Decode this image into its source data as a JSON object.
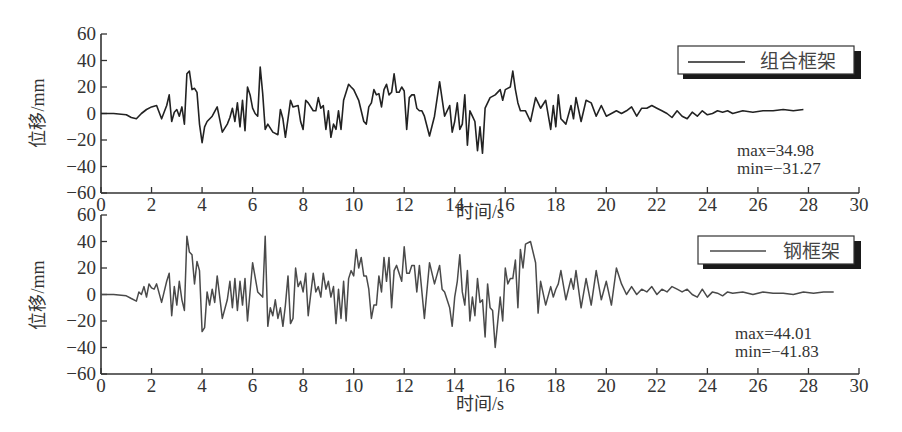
{
  "chart_data": [
    {
      "type": "line",
      "title": "",
      "xlabel": "时间/s",
      "ylabel": "位移/mm",
      "xlim": [
        0,
        30
      ],
      "ylim": [
        -60,
        60
      ],
      "xticks": [
        0,
        2,
        4,
        6,
        8,
        10,
        12,
        14,
        16,
        18,
        20,
        22,
        24,
        26,
        28,
        30
      ],
      "yticks": [
        60,
        40,
        20,
        0,
        -20,
        -40,
        -60
      ],
      "grid": false,
      "legend": {
        "position": "upper right",
        "entries": [
          "组合框架"
        ]
      },
      "annotations": [
        "max=34.98",
        "min=−31.27"
      ],
      "series": [
        {
          "name": "组合框架",
          "color": "#222222",
          "t": [
            0,
            0.5,
            1,
            1.2,
            1.4,
            1.6,
            1.8,
            2,
            2.2,
            2.4,
            2.6,
            2.7,
            2.8,
            2.9,
            3.0,
            3.1,
            3.2,
            3.3,
            3.4,
            3.5,
            3.6,
            3.7,
            3.8,
            3.9,
            4.0,
            4.1,
            4.2,
            4.4,
            4.6,
            4.8,
            5.0,
            5.1,
            5.2,
            5.3,
            5.4,
            5.5,
            5.6,
            5.7,
            5.8,
            5.9,
            6.0,
            6.1,
            6.2,
            6.3,
            6.4,
            6.5,
            6.6,
            6.8,
            7.0,
            7.1,
            7.2,
            7.3,
            7.4,
            7.5,
            7.6,
            7.8,
            7.9,
            8.0,
            8.1,
            8.2,
            8.4,
            8.5,
            8.6,
            8.7,
            8.8,
            8.9,
            9.0,
            9.1,
            9.2,
            9.3,
            9.4,
            9.5,
            9.6,
            9.8,
            9.9,
            10.0,
            10.2,
            10.4,
            10.5,
            10.6,
            10.7,
            10.8,
            10.9,
            11.0,
            11.1,
            11.2,
            11.3,
            11.4,
            11.5,
            11.6,
            11.7,
            11.8,
            11.9,
            12.0,
            12.1,
            12.2,
            12.3,
            12.4,
            12.5,
            12.6,
            12.7,
            12.8,
            13.0,
            13.2,
            13.4,
            13.6,
            13.8,
            13.9,
            14.0,
            14.1,
            14.2,
            14.3,
            14.4,
            14.5,
            14.6,
            14.7,
            14.8,
            14.9,
            15.0,
            15.1,
            15.2,
            15.3,
            15.4,
            15.6,
            15.8,
            15.9,
            16.0,
            16.2,
            16.3,
            16.4,
            16.5,
            16.6,
            16.8,
            17.0,
            17.2,
            17.3,
            17.4,
            17.6,
            17.8,
            17.9,
            18.0,
            18.1,
            18.2,
            18.4,
            18.6,
            18.7,
            18.8,
            19.0,
            19.2,
            19.4,
            19.6,
            19.8,
            20.0,
            20.2,
            20.4,
            20.6,
            20.8,
            21.0,
            21.2,
            21.4,
            21.6,
            21.8,
            22.0,
            22.2,
            22.4,
            22.6,
            22.8,
            23.0,
            23.2,
            23.4,
            23.6,
            23.8,
            24.0,
            24.2,
            24.4,
            24.6,
            24.8,
            25.0,
            25.4,
            25.8,
            26.2,
            26.6,
            27.0,
            27.4,
            27.8,
            28.2,
            28.6,
            29.0,
            29.4,
            29.8,
            30
          ],
          "y": [
            0,
            0,
            -1,
            -3,
            -4,
            0,
            3,
            5,
            6,
            -4,
            6,
            14,
            -6,
            1,
            3,
            -2,
            5,
            -8,
            30,
            32,
            18,
            19,
            16,
            -8,
            -22,
            -10,
            -6,
            -2,
            5,
            -14,
            -8,
            -3,
            4,
            -6,
            8,
            -10,
            10,
            -13,
            20,
            14,
            4,
            0,
            -2,
            35,
            15,
            -12,
            -8,
            -14,
            -16,
            3,
            -4,
            -18,
            -4,
            10,
            5,
            6,
            -6,
            -12,
            10,
            8,
            2,
            2,
            12,
            4,
            6,
            -12,
            2,
            -18,
            -8,
            -12,
            2,
            -12,
            10,
            22,
            20,
            18,
            10,
            -6,
            -8,
            5,
            8,
            18,
            14,
            15,
            5,
            18,
            22,
            14,
            16,
            30,
            16,
            16,
            20,
            17,
            -12,
            12,
            14,
            14,
            4,
            2,
            2,
            -2,
            -17,
            -2,
            24,
            -2,
            6,
            -14,
            -6,
            8,
            -12,
            -8,
            14,
            -24,
            2,
            -2,
            -6,
            -28,
            -10,
            -30,
            4,
            8,
            12,
            14,
            18,
            10,
            18,
            20,
            32,
            18,
            8,
            2,
            2,
            -6,
            12,
            8,
            4,
            10,
            -12,
            6,
            -10,
            14,
            -4,
            -8,
            6,
            -4,
            12,
            -6,
            10,
            8,
            -2,
            6,
            -2,
            0,
            2,
            0,
            2,
            5,
            -2,
            4,
            4,
            6,
            4,
            2,
            0,
            -3,
            2,
            -2,
            -4,
            1,
            -2,
            2,
            -1,
            0,
            2,
            1,
            2,
            0,
            2,
            1,
            2,
            2,
            3,
            2,
            3
          ]
        }
      ]
    },
    {
      "type": "line",
      "title": "",
      "xlabel": "时间/s",
      "ylabel": "位移/mm",
      "xlim": [
        0,
        30
      ],
      "ylim": [
        -60,
        60
      ],
      "xticks": [
        0,
        2,
        4,
        6,
        8,
        10,
        12,
        14,
        16,
        18,
        20,
        22,
        24,
        26,
        28,
        30
      ],
      "yticks": [
        60,
        40,
        20,
        0,
        -20,
        -40,
        -60
      ],
      "grid": false,
      "legend": {
        "position": "upper right",
        "entries": [
          "钢框架"
        ]
      },
      "annotations": [
        "max=44.01",
        "min=−41.83"
      ],
      "series": [
        {
          "name": "钢框架",
          "color": "#4a4a4a",
          "t": [
            0,
            0.5,
            1,
            1.2,
            1.4,
            1.5,
            1.6,
            1.7,
            1.8,
            1.9,
            2.0,
            2.1,
            2.2,
            2.4,
            2.6,
            2.7,
            2.8,
            2.9,
            3.0,
            3.1,
            3.2,
            3.3,
            3.4,
            3.5,
            3.6,
            3.7,
            3.8,
            3.9,
            4.0,
            4.1,
            4.2,
            4.3,
            4.4,
            4.5,
            4.6,
            4.8,
            5.0,
            5.1,
            5.2,
            5.3,
            5.4,
            5.5,
            5.6,
            5.7,
            5.8,
            6.0,
            6.2,
            6.4,
            6.5,
            6.6,
            6.7,
            6.8,
            6.9,
            7.0,
            7.1,
            7.2,
            7.3,
            7.4,
            7.5,
            7.6,
            7.7,
            7.8,
            7.9,
            8.0,
            8.1,
            8.2,
            8.4,
            8.5,
            8.6,
            8.7,
            8.8,
            8.9,
            9.0,
            9.1,
            9.2,
            9.3,
            9.4,
            9.5,
            9.6,
            9.7,
            9.8,
            9.9,
            10.0,
            10.1,
            10.2,
            10.3,
            10.4,
            10.5,
            10.6,
            10.7,
            10.8,
            10.9,
            11.0,
            11.1,
            11.2,
            11.3,
            11.4,
            11.5,
            11.6,
            11.7,
            11.8,
            11.9,
            12.0,
            12.1,
            12.2,
            12.3,
            12.4,
            12.5,
            12.6,
            12.8,
            13.0,
            13.2,
            13.4,
            13.5,
            13.6,
            13.8,
            13.9,
            14.0,
            14.1,
            14.2,
            14.3,
            14.4,
            14.5,
            14.6,
            14.7,
            14.8,
            14.9,
            15.0,
            15.1,
            15.2,
            15.3,
            15.4,
            15.5,
            15.6,
            15.8,
            15.9,
            16.0,
            16.1,
            16.2,
            16.3,
            16.4,
            16.5,
            16.6,
            16.7,
            16.8,
            17.0,
            17.2,
            17.3,
            17.4,
            17.6,
            17.8,
            17.9,
            18.0,
            18.1,
            18.2,
            18.4,
            18.6,
            18.7,
            18.8,
            19.0,
            19.2,
            19.4,
            19.6,
            19.8,
            20.0,
            20.2,
            20.4,
            20.6,
            20.8,
            21.0,
            21.2,
            21.4,
            21.6,
            21.8,
            22.0,
            22.2,
            22.4,
            22.6,
            22.8,
            23.0,
            23.2,
            23.4,
            23.6,
            23.8,
            24.0,
            24.2,
            24.4,
            24.6,
            24.8,
            25.0,
            25.4,
            25.8,
            26.2,
            26.6,
            27.0,
            27.4,
            27.8,
            28.2,
            28.6,
            29.0,
            29.4,
            29.8,
            30
          ],
          "y": [
            0,
            0,
            -1,
            -3,
            -5,
            2,
            0,
            6,
            -2,
            8,
            5,
            4,
            8,
            -6,
            10,
            16,
            -16,
            6,
            -8,
            10,
            -4,
            -12,
            44,
            32,
            30,
            8,
            25,
            18,
            -28,
            -25,
            2,
            -8,
            4,
            -6,
            14,
            -18,
            -4,
            10,
            -10,
            12,
            -12,
            10,
            -8,
            12,
            -20,
            24,
            2,
            -2,
            44,
            -24,
            -10,
            -16,
            -4,
            -18,
            -10,
            -24,
            -8,
            14,
            -22,
            -18,
            20,
            6,
            10,
            2,
            16,
            -16,
            16,
            2,
            6,
            -2,
            16,
            4,
            10,
            -2,
            6,
            -22,
            4,
            -18,
            10,
            -20,
            12,
            18,
            14,
            34,
            20,
            28,
            14,
            14,
            4,
            -18,
            -8,
            -8,
            14,
            2,
            28,
            10,
            28,
            -10,
            18,
            22,
            16,
            10,
            36,
            16,
            16,
            22,
            22,
            2,
            22,
            -18,
            24,
            8,
            22,
            4,
            2,
            -10,
            -24,
            -2,
            10,
            30,
            2,
            -8,
            18,
            -20,
            -2,
            -16,
            12,
            -6,
            -4,
            -32,
            8,
            -10,
            -12,
            -40,
            -2,
            -20,
            20,
            8,
            12,
            12,
            26,
            -10,
            34,
            20,
            38,
            40,
            24,
            -14,
            10,
            -8,
            6,
            -2,
            4,
            8,
            18,
            -4,
            12,
            4,
            18,
            -10,
            12,
            -8,
            18,
            -4,
            10,
            -8,
            20,
            8,
            0,
            6,
            0,
            4,
            2,
            6,
            0,
            4,
            2,
            6,
            4,
            2,
            4,
            0,
            -2,
            4,
            -2,
            2,
            1,
            -1,
            2,
            1,
            2,
            0,
            2,
            1,
            1,
            0,
            2,
            1,
            2,
            2
          ]
        }
      ]
    }
  ],
  "plot_top": {
    "ylabel": "位移/mm",
    "xlabel": "时间/s",
    "legend_label": "组合框架",
    "max_text": "max=34.98",
    "min_text": "min=−31.27",
    "yticks": [
      "60",
      "40",
      "20",
      "0",
      "−20",
      "−40",
      "−60"
    ],
    "xticks": [
      "0",
      "2",
      "4",
      "6",
      "8",
      "10",
      "12",
      "14",
      "16",
      "18",
      "20",
      "22",
      "24",
      "26",
      "28",
      "30"
    ]
  },
  "plot_bottom": {
    "ylabel": "位移/mm",
    "xlabel": "时间/s",
    "legend_label": "钢框架",
    "max_text": "max=44.01",
    "min_text": "min=−41.83",
    "yticks": [
      "60",
      "40",
      "20",
      "0",
      "−20",
      "−40",
      "−60"
    ],
    "xticks": [
      "0",
      "2",
      "4",
      "6",
      "8",
      "10",
      "12",
      "14",
      "16",
      "18",
      "20",
      "22",
      "24",
      "26",
      "28",
      "30"
    ]
  }
}
